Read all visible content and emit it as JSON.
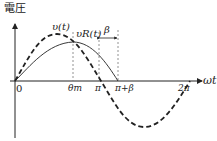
{
  "diagram": {
    "y_axis_label": "電圧",
    "x_axis_label": "ωt",
    "curves": [
      {
        "name": "v(t)",
        "style": "dashed",
        "label": "υ(t)"
      },
      {
        "name": "vR(t)",
        "style": "solid",
        "label": "υR(t)"
      }
    ],
    "ticks": {
      "origin": "0",
      "theta_m": "θm",
      "pi": "π",
      "pi_plus_beta": "π+β",
      "two_pi": "2π"
    },
    "annotation_beta": "β",
    "colors": {
      "line": "#222222",
      "dash": "#777777"
    }
  }
}
